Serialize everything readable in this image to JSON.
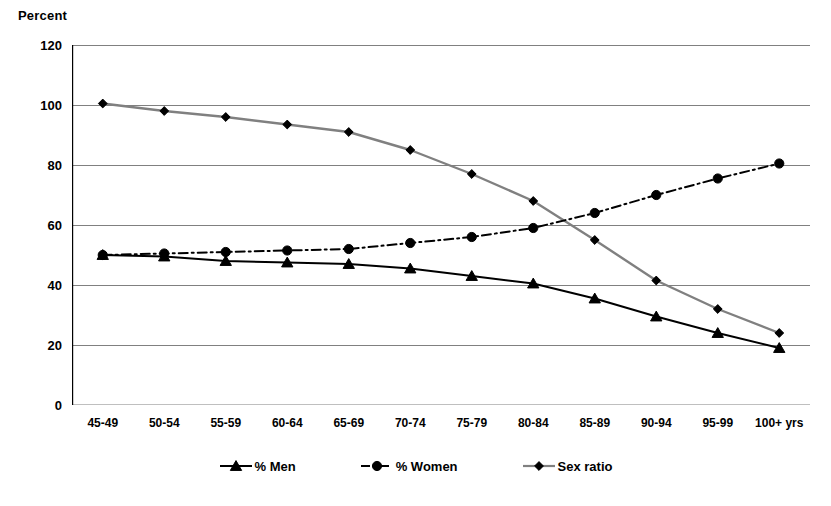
{
  "chart_data": {
    "type": "line",
    "title": "",
    "ylabel": "Percent",
    "xlabel": "",
    "categories": [
      "45-49",
      "50-54",
      "55-59",
      "60-64",
      "65-69",
      "70-74",
      "75-79",
      "80-84",
      "85-89",
      "90-94",
      "95-99",
      "100+ yrs"
    ],
    "ylim": [
      0,
      120
    ],
    "yticks": [
      0,
      20,
      40,
      60,
      80,
      100,
      120
    ],
    "ytick_labels": [
      "0",
      "20",
      "40",
      "60",
      "80",
      "100",
      "120"
    ],
    "grid": true,
    "legend_position": "bottom",
    "series": [
      {
        "name": "% Men",
        "marker": "triangle",
        "line_style": "solid",
        "color": "#000000",
        "values": [
          50,
          49.5,
          48,
          47.5,
          47,
          45.5,
          43,
          40.5,
          35.5,
          29.5,
          24,
          19
        ]
      },
      {
        "name": "% Women",
        "marker": "circle",
        "line_style": "dash-dot",
        "color": "#000000",
        "values": [
          50,
          50.5,
          51,
          51.5,
          52,
          54,
          56,
          59,
          64,
          70,
          75.5,
          80.5
        ]
      },
      {
        "name": "Sex ratio",
        "marker": "diamond",
        "line_style": "solid",
        "color": "#808080",
        "values": [
          100.5,
          98,
          96,
          93.5,
          91,
          85,
          77,
          68,
          55,
          41.5,
          32,
          24
        ]
      }
    ]
  },
  "legend": {
    "items": [
      {
        "label": "% Men"
      },
      {
        "label": "% Women"
      },
      {
        "label": "Sex ratio"
      }
    ]
  },
  "colors": {
    "axis": "#000000",
    "grid": "#808080",
    "men": "#000000",
    "women": "#000000",
    "sex_ratio": "#8c8c8c",
    "background": "#ffffff"
  }
}
